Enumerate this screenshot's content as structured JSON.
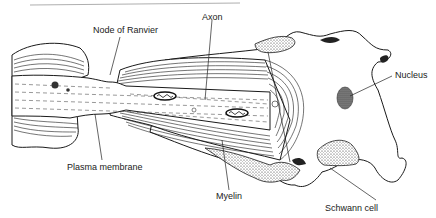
{
  "labels": {
    "node_of_ranvier": "Node of Ranvier",
    "axon": "Axon",
    "nucleus": "Nucleus",
    "plasma_membrane": "Plasma membrane",
    "myelin": "Myelin",
    "schwann_cell": "Schwann cell"
  },
  "colors": {
    "ink": "#1a1a1a",
    "text": "#222222",
    "background": "#ffffff"
  }
}
